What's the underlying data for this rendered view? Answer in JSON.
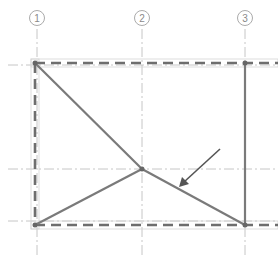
{
  "diagram": {
    "type": "structural-grid-plan",
    "grid_labels": [
      "1",
      "2",
      "3"
    ],
    "colors": {
      "background": "#ffffff",
      "gridline": "#b8b8b8",
      "bubble": "#a0a0a0",
      "member": "#7a7a7a",
      "dashed_beam": "#6e6e6e",
      "outline": "#cccccc",
      "arrow": "#555555",
      "node": "#666666"
    }
  }
}
